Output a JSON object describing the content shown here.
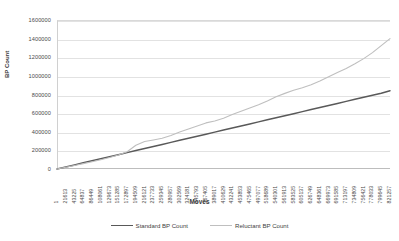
{
  "chart_data": {
    "type": "line",
    "title": "",
    "xlabel": "Moves",
    "ylabel": "BP Count",
    "grid": true,
    "legend_position": "bottom",
    "ylim": [
      0,
      1600000
    ],
    "yticks": [
      0,
      200000,
      400000,
      600000,
      800000,
      1000000,
      1200000,
      1400000,
      1600000
    ],
    "ytick_labels": [
      "0",
      "200000",
      "400000",
      "600000",
      "800000",
      "1000000",
      "1200000",
      "1400000",
      "1600000"
    ],
    "x_tick_step": 21612,
    "categories": [
      "1",
      "21613",
      "43225",
      "64837",
      "86449",
      "108061",
      "129673",
      "151285",
      "172897",
      "194509",
      "216121",
      "237733",
      "259345",
      "280957",
      "302569",
      "324181",
      "345793",
      "367405",
      "389017",
      "410629",
      "432241",
      "453853",
      "475465",
      "497077",
      "518689",
      "540301",
      "561913",
      "583525",
      "605137",
      "626749",
      "648361",
      "669973",
      "691585",
      "713197",
      "734809",
      "756421",
      "778033",
      "799645",
      "821257"
    ],
    "series": [
      {
        "name": "Standard BP Count",
        "color": "#595959",
        "width": 1.5,
        "values": [
          0,
          22000,
          44000,
          66000,
          88000,
          110000,
          132000,
          154000,
          176000,
          198000,
          220000,
          242000,
          264000,
          286000,
          308000,
          330000,
          352000,
          374000,
          396000,
          418000,
          440000,
          462000,
          484000,
          506000,
          528000,
          550000,
          572000,
          594000,
          616000,
          638000,
          660000,
          682000,
          704000,
          726000,
          748000,
          770000,
          792000,
          814000,
          840000
        ]
      },
      {
        "name": "Reluctant BP Count",
        "color": "#bfbfbf",
        "width": 1.1,
        "values": [
          0,
          18000,
          38000,
          58000,
          78000,
          100000,
          124000,
          150000,
          185000,
          255000,
          295000,
          312000,
          330000,
          360000,
          398000,
          430000,
          462000,
          495000,
          515000,
          545000,
          585000,
          620000,
          655000,
          690000,
          730000,
          775000,
          812000,
          845000,
          872000,
          905000,
          945000,
          990000,
          1035000,
          1080000,
          1130000,
          1185000,
          1250000,
          1325000,
          1400000
        ]
      }
    ]
  }
}
